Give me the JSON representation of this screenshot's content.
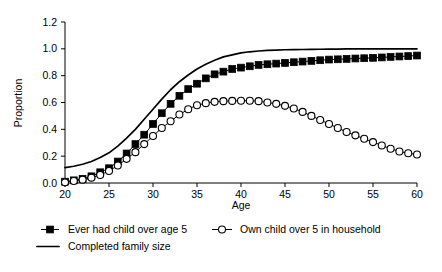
{
  "chart_data": {
    "type": "line",
    "title": "",
    "xlabel": "Age",
    "ylabel": "Proportion",
    "xlim": [
      20,
      60
    ],
    "ylim": [
      0.0,
      1.2
    ],
    "xticks": [
      20,
      25,
      30,
      35,
      40,
      45,
      50,
      55,
      60
    ],
    "yticks": [
      0.0,
      0.2,
      0.4,
      0.6,
      0.8,
      1.0,
      1.2
    ],
    "xtick_labels": [
      "20",
      "25",
      "30",
      "35",
      "40",
      "45",
      "50",
      "55",
      "60"
    ],
    "ytick_labels": [
      "0.0",
      "0.2",
      "0.4",
      "0.6",
      "0.8",
      "1.0",
      "1.2"
    ],
    "grid": false,
    "legend_position": "bottom",
    "x": [
      20,
      21,
      22,
      23,
      24,
      25,
      26,
      27,
      28,
      29,
      30,
      31,
      32,
      33,
      34,
      35,
      36,
      37,
      38,
      39,
      40,
      41,
      42,
      43,
      44,
      45,
      46,
      47,
      48,
      49,
      50,
      51,
      52,
      53,
      54,
      55,
      56,
      57,
      58,
      59,
      60
    ],
    "series": [
      {
        "name": "Ever had child over age 5",
        "marker": "filled-square",
        "line": "solid-thin",
        "color": "#000000",
        "values": [
          0.01,
          0.02,
          0.03,
          0.05,
          0.08,
          0.11,
          0.16,
          0.22,
          0.29,
          0.36,
          0.44,
          0.52,
          0.59,
          0.65,
          0.7,
          0.74,
          0.78,
          0.81,
          0.83,
          0.85,
          0.86,
          0.87,
          0.88,
          0.885,
          0.89,
          0.895,
          0.9,
          0.905,
          0.91,
          0.915,
          0.92,
          0.922,
          0.925,
          0.928,
          0.93,
          0.933,
          0.936,
          0.94,
          0.943,
          0.946,
          0.95
        ]
      },
      {
        "name": "Own child over 5 in household",
        "marker": "open-circle",
        "line": "solid-thin",
        "color": "#000000",
        "values": [
          0.005,
          0.015,
          0.025,
          0.04,
          0.06,
          0.09,
          0.13,
          0.18,
          0.23,
          0.29,
          0.35,
          0.41,
          0.46,
          0.51,
          0.55,
          0.58,
          0.595,
          0.605,
          0.61,
          0.612,
          0.613,
          0.613,
          0.61,
          0.6,
          0.59,
          0.575,
          0.555,
          0.53,
          0.5,
          0.47,
          0.44,
          0.41,
          0.38,
          0.355,
          0.33,
          0.305,
          0.28,
          0.255,
          0.235,
          0.222,
          0.212
        ]
      },
      {
        "name": "Completed family size",
        "marker": "none",
        "line": "solid-thick",
        "color": "#000000",
        "values": [
          0.115,
          0.125,
          0.14,
          0.16,
          0.19,
          0.225,
          0.275,
          0.335,
          0.4,
          0.475,
          0.55,
          0.625,
          0.695,
          0.755,
          0.805,
          0.85,
          0.885,
          0.915,
          0.94,
          0.955,
          0.97,
          0.978,
          0.984,
          0.988,
          0.991,
          0.993,
          0.994,
          0.995,
          0.996,
          0.997,
          0.998,
          0.998,
          0.999,
          0.999,
          1.0,
          1.0,
          1.0,
          1.0,
          1.0,
          1.0,
          1.0
        ]
      }
    ],
    "legend": [
      {
        "label": "Ever had child over age 5",
        "marker": "filled-square"
      },
      {
        "label": "Own child over 5 in household",
        "marker": "open-circle"
      },
      {
        "label": "Completed family size",
        "marker": "line"
      }
    ]
  }
}
